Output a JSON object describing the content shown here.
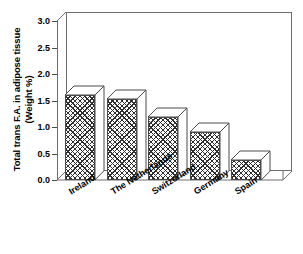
{
  "chart_data": {
    "type": "bar",
    "title": "",
    "xlabel": "",
    "ylabel": "Total trans F.A. in adipose tissue (Weight %)",
    "ylabel_lines": [
      "Total trans F.A. in adipose tissue",
      "(Weight %)"
    ],
    "categories": [
      "Ireland",
      "The Netherlands",
      "Switzerland",
      "Germany",
      "Spain"
    ],
    "values": [
      1.6,
      1.53,
      1.18,
      0.9,
      0.38
    ],
    "ylim": [
      0.0,
      3.0
    ],
    "yticks": [
      "0.0",
      "0.5",
      "1.0",
      "1.5",
      "2.0",
      "2.5",
      "3.0"
    ],
    "ytick_values": [
      0.0,
      0.5,
      1.0,
      1.5,
      2.0,
      2.5,
      3.0
    ],
    "grid": false,
    "legend": "none",
    "style": "3d-bar-crosshatch",
    "colors": {
      "bar_fill": "#ffffff",
      "bar_hatch": "#2e2e2e",
      "bar_edge": "#4a4a4a",
      "frame": "#6e6e6e",
      "text": "#000000",
      "background": "#ffffff"
    }
  }
}
